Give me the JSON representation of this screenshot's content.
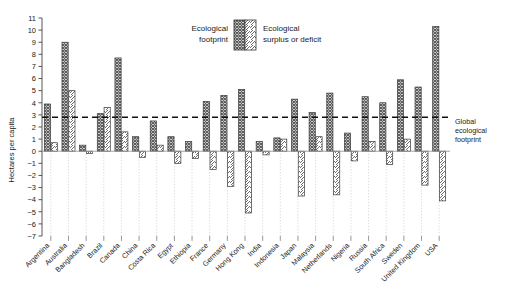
{
  "chart_data": {
    "type": "bar",
    "title": "",
    "subtitle": "",
    "xlabel": "",
    "ylabel": "Hectares per capita",
    "ylim": [
      -7,
      11
    ],
    "ytick_values": [
      -7,
      -6,
      -5,
      -4,
      -3,
      -2,
      -1,
      0,
      1,
      2,
      3,
      4,
      5,
      6,
      7,
      8,
      9,
      10,
      11
    ],
    "ytick_labels": [
      "−7",
      "−6",
      "−5",
      "−4",
      "−3",
      "−2",
      "−1",
      "0",
      "1",
      "2",
      "3",
      "4",
      "5",
      "6",
      "7",
      "8",
      "9",
      "10",
      "11"
    ],
    "grid": "vertical-dotted-per-category",
    "legend_position": "top-center",
    "categories": [
      "Argentina",
      "Australia",
      "Bangladesh",
      "Brazil",
      "Canada",
      "China",
      "Costa Rica",
      "Egypt",
      "Ethiopia",
      "France",
      "Germany",
      "Hong Kong",
      "India",
      "Indonesia",
      "Japan",
      "Malaysia",
      "Netherlands",
      "Nigeria",
      "Russia",
      "South Africa",
      "Sweden",
      "United Kingdom",
      "USA"
    ],
    "series": [
      {
        "name": "Ecological footprint",
        "pattern": "cross-hatch",
        "values": [
          3.9,
          9.0,
          0.5,
          3.1,
          7.7,
          1.2,
          2.5,
          1.2,
          0.8,
          4.1,
          4.6,
          5.1,
          0.8,
          1.1,
          4.3,
          3.2,
          4.8,
          1.5,
          4.5,
          4.0,
          5.9,
          5.3,
          10.3
        ]
      },
      {
        "name": "Ecological surplus or deficit",
        "pattern": "diagonal-hatch",
        "values": [
          0.7,
          5.0,
          -0.2,
          3.6,
          1.6,
          -0.5,
          0.5,
          -1.0,
          -0.6,
          -1.5,
          -2.9,
          -5.1,
          -0.3,
          1.0,
          -3.7,
          1.2,
          -3.6,
          -0.8,
          0.8,
          -1.1,
          1.0,
          -2.8,
          -4.1
        ]
      }
    ],
    "reference_line": {
      "value": 2.8,
      "style": "dashed",
      "label_line1": "Global",
      "label_line2": "ecological",
      "label_line3": "footprint"
    }
  },
  "legend": {
    "item1_line1": "Ecological",
    "item1_line2": "footprint",
    "item2_line1": "Ecological",
    "item2_line2": "surplus or deficit"
  }
}
